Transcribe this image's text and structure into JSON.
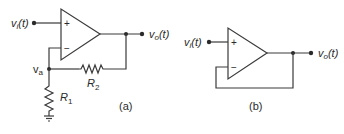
{
  "figure": {
    "circuit_a": {
      "caption": "(a)",
      "input_label_v": "v",
      "input_label_sub": "i",
      "input_label_t": "(t)",
      "output_label_v": "v",
      "output_label_sub": "o",
      "output_label_t": "(t)",
      "plus_sign": "+",
      "minus_sign": "−",
      "node_label_v": "v",
      "node_label_sub": "a",
      "r1_label": "R",
      "r1_sub": "1",
      "r2_label": "R",
      "r2_sub": "2"
    },
    "circuit_b": {
      "caption": "(b)",
      "input_label_v": "v",
      "input_label_sub": "i",
      "input_label_t": "(t)",
      "output_label_v": "v",
      "output_label_sub": "o",
      "output_label_t": "(t)",
      "plus_sign": "+",
      "minus_sign": "−"
    }
  }
}
